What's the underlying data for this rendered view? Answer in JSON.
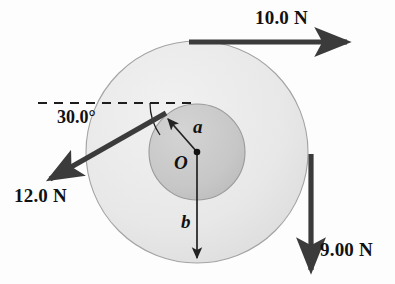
{
  "figure": {
    "background_color": "#fdfdfd"
  },
  "colors": {
    "outer_disk_fill": "#e9e9e9",
    "inner_disk_fill": "#c9c9c9",
    "disk_stroke": "#9a9a9a",
    "arrow_color": "#3b3b3b",
    "thin_line_color": "#222222",
    "label_color": "#111111"
  },
  "geometry": {
    "center": {
      "x": 197,
      "y": 152
    },
    "outer_radius": 111,
    "inner_radius": 48,
    "dashed_line": {
      "x1": 38,
      "y1": 103,
      "x2": 196,
      "y2": 103
    },
    "angle_arc_radius": 56
  },
  "forces": [
    {
      "id": "force-top",
      "label": "10.0 N",
      "magnitude": 10.0,
      "unit": "N",
      "direction": "right",
      "angle_deg": 0,
      "tangent_point": "top of outer circle",
      "arrow": {
        "x1": 189,
        "y1": 42,
        "x2": 352,
        "y2": 42
      }
    },
    {
      "id": "force-left",
      "label": "12.0 N",
      "magnitude": 12.0,
      "unit": "N",
      "direction": "down-left",
      "angle_deg": 210,
      "tangent_point": "inner circle, upper left",
      "arrow": {
        "x1": 166,
        "y1": 113,
        "x2": 44,
        "y2": 182
      }
    },
    {
      "id": "force-right",
      "label": "9.00 N",
      "magnitude": 9.0,
      "unit": "N",
      "direction": "down",
      "angle_deg": 270,
      "tangent_point": "right of outer circle",
      "arrow": {
        "x1": 311,
        "y1": 154,
        "x2": 311,
        "y2": 276
      }
    }
  ],
  "angle": {
    "label": "30.0°",
    "value_deg": 30.0,
    "between": [
      "horizontal dashed line",
      "12.0 N force line"
    ]
  },
  "radii": [
    {
      "id": "radius-a",
      "label": "a",
      "description": "inner radius",
      "arrow": {
        "x1": 197,
        "y1": 152,
        "x2": 166,
        "y2": 116
      }
    },
    {
      "id": "radius-b",
      "label": "b",
      "description": "outer radius",
      "arrow": {
        "x1": 197,
        "y1": 152,
        "x2": 197,
        "y2": 262
      }
    }
  ],
  "origin": {
    "label": "O",
    "description": "center of the pulley",
    "x": 197,
    "y": 152
  }
}
